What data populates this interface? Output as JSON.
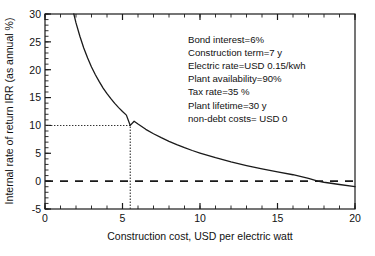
{
  "chart_data": {
    "type": "line",
    "title": "",
    "xlabel": "Construction cost, USD per electric watt",
    "ylabel": "Internal rate of return IRR (as annual %)",
    "xlim": [
      0,
      20
    ],
    "ylim": [
      -5,
      30
    ],
    "xticks": [
      0,
      5,
      10,
      15,
      20
    ],
    "xtick_labels": [
      "0",
      "5",
      "10",
      "15",
      "20"
    ],
    "yticks": [
      -5,
      0,
      5,
      10,
      15,
      20,
      25,
      30
    ],
    "ytick_labels": [
      "-5",
      "0",
      "5",
      "10",
      "15",
      "20",
      "25",
      "30"
    ],
    "x_minor_tick_step": 1,
    "y_minor_tick_step": 1,
    "grid": false,
    "legend": null,
    "series": [
      {
        "name": "IRR vs construction cost",
        "style": "solid",
        "color": "#1a1a1a",
        "x": [
          1.86,
          2.0,
          2.25,
          2.5,
          2.75,
          3.0,
          3.25,
          3.5,
          3.75,
          4.0,
          4.25,
          4.5,
          4.75,
          5.0,
          5.25,
          5.5,
          5.75,
          6.0,
          6.5,
          7.0,
          7.5,
          8.0,
          8.5,
          9.0,
          9.5,
          10.0,
          11.0,
          12.0,
          13.0,
          14.0,
          15.0,
          16.0,
          17.0,
          17.6,
          18.0,
          19.0,
          20.0
        ],
        "y": [
          30.0,
          28.4,
          26.0,
          23.9,
          22.1,
          20.5,
          19.1,
          17.85,
          16.7,
          15.7,
          14.8,
          13.95,
          13.2,
          12.5,
          11.85,
          10.0,
          10.75,
          10.25,
          9.3,
          8.5,
          7.8,
          7.15,
          6.55,
          6.0,
          5.5,
          5.05,
          4.2,
          3.45,
          2.8,
          2.2,
          1.65,
          1.15,
          0.5,
          0.0,
          -0.2,
          -0.6,
          -1.0
        ]
      }
    ],
    "reference_lines": [
      {
        "name": "zero-irr-line",
        "orientation": "horizontal",
        "value": 0,
        "style": "dashed",
        "color": "#1a1a1a"
      },
      {
        "name": "irr-10-guide",
        "orientation": "horizontal",
        "value": 10,
        "from_x": 0,
        "to_x": 5.5,
        "style": "dotted",
        "color": "#333333"
      },
      {
        "name": "cost-5p5-guide",
        "orientation": "vertical",
        "value": 5.5,
        "from_y": -5,
        "to_y": 10,
        "style": "dotted",
        "color": "#333333"
      }
    ],
    "annotations": [
      "Bond interest=6%",
      "Construction term=7 y",
      "Electric rate=USD 0.15/kwh",
      "Plant availability=90%",
      "Tax rate=35 %",
      "Plant lifetime=30 y",
      "non-debt costs= USD 0"
    ]
  }
}
